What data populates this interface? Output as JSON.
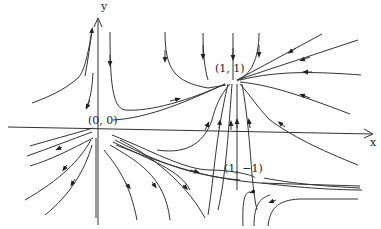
{
  "diagram": {
    "type": "phase portrait",
    "axes": {
      "x_label": "x",
      "y_label": "y"
    },
    "equilibria": [
      {
        "label": "(0, 0)",
        "x": 98,
        "y": 120
      },
      {
        "label": "(1, 1)",
        "x": 227,
        "y": 70
      },
      {
        "label": "(1, −1)",
        "x": 241,
        "y": 171
      }
    ],
    "arrow_color": "#333333"
  }
}
